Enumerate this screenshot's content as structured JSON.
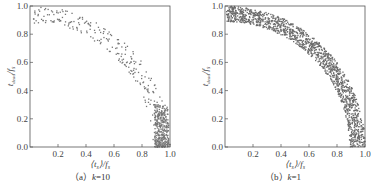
{
  "chart_data": [
    {
      "type": "scatter",
      "panel": "a",
      "caption_prefix": "（a）",
      "caption_k_label": "k",
      "caption_value": "=10",
      "xlabel": "⟨t_s⟩/f_s",
      "ylabel": "t_dead/f_s",
      "xlim": [
        0.0,
        1.0
      ],
      "ylim": [
        0.0,
        1.0
      ],
      "xticks": [
        "0.2",
        "0.4",
        "0.6",
        "0.8",
        "1.0"
      ],
      "yticks": [
        "0.0",
        "0.2",
        "0.4",
        "0.6",
        "0.8",
        "1.0"
      ],
      "grid": false,
      "legend": null,
      "marker_color": "#777777",
      "description": "Sparse points along quarter-circle arc of radius ~0.9-1.0; dense cluster at x 0.9-1.0, y 0-0.3",
      "generator": {
        "seed": 7,
        "n_arc": 260,
        "n_cluster": 320,
        "r_min": 0.88,
        "r_max": 1.0,
        "cluster_x": [
          0.89,
          0.99
        ],
        "cluster_y": [
          0.0,
          0.3
        ]
      }
    },
    {
      "type": "scatter",
      "panel": "b",
      "caption_prefix": "（b）",
      "caption_k_label": "k",
      "caption_value": "=1",
      "xlabel": "⟨t_s⟩/f_s",
      "ylabel": "t_dead/f_s",
      "xlim": [
        0.0,
        1.0
      ],
      "ylim": [
        0.0,
        1.0
      ],
      "xticks": [
        "0.2",
        "0.4",
        "0.6",
        "0.8",
        "1.0"
      ],
      "yticks": [
        "0.0",
        "0.2",
        "0.4",
        "0.6",
        "0.8",
        "1.0"
      ],
      "grid": false,
      "legend": null,
      "marker_color": "#6a6a6a",
      "description": "Dense uniform band of points along quarter-circle arc between radius ~0.9 and 1.0",
      "generator": {
        "seed": 13,
        "n_arc": 1400,
        "n_cluster": 0,
        "r_min": 0.89,
        "r_max": 1.0,
        "cluster_x": [
          0,
          0
        ],
        "cluster_y": [
          0,
          0
        ]
      }
    }
  ]
}
